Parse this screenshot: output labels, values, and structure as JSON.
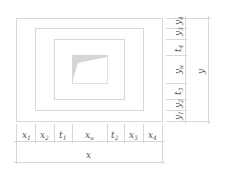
{
  "diagram": {
    "type": "nested-rectangles-dimension-drawing",
    "colors": {
      "line": "#d8d8d8",
      "fill": "#d6d6d6",
      "text": "#555555"
    },
    "bottom_labels": [
      {
        "base": "x",
        "sub": "1"
      },
      {
        "base": "x",
        "sub": "2"
      },
      {
        "base": "t",
        "sub": "1"
      },
      {
        "base": "x",
        "sub": "u"
      },
      {
        "base": "t",
        "sub": "2"
      },
      {
        "base": "x",
        "sub": "3"
      },
      {
        "base": "x",
        "sub": "4"
      }
    ],
    "bottom_total": "x",
    "right_labels": [
      {
        "base": "y",
        "sub": "4"
      },
      {
        "base": "y",
        "sub": "3"
      },
      {
        "base": "t",
        "sub": "4"
      },
      {
        "base": "y",
        "sub": "u"
      },
      {
        "base": "t",
        "sub": "3"
      },
      {
        "base": "y",
        "sub": "2"
      },
      {
        "base": "y",
        "sub": "1"
      }
    ],
    "right_total": "y"
  }
}
